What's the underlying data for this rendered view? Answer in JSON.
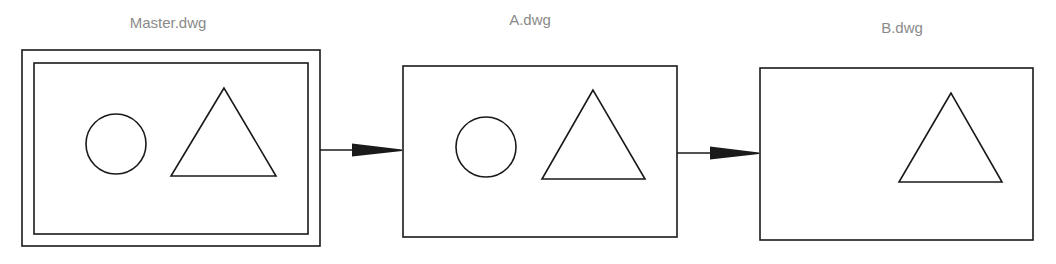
{
  "diagram": {
    "colors": {
      "stroke": "#1a1a1a",
      "label": "#8a8a8a",
      "background": "#ffffff"
    },
    "drawings": [
      {
        "id": "master",
        "label": "Master.dwg",
        "shapes": [
          "circle",
          "triangle"
        ],
        "double_border": true
      },
      {
        "id": "a",
        "label": "A.dwg",
        "shapes": [
          "circle",
          "triangle"
        ],
        "double_border": false
      },
      {
        "id": "b",
        "label": "B.dwg",
        "shapes": [
          "triangle"
        ],
        "double_border": false
      }
    ],
    "arrows": [
      {
        "from": "Master.dwg",
        "to": "A.dwg"
      },
      {
        "from": "A.dwg",
        "to": "B.dwg"
      }
    ]
  }
}
